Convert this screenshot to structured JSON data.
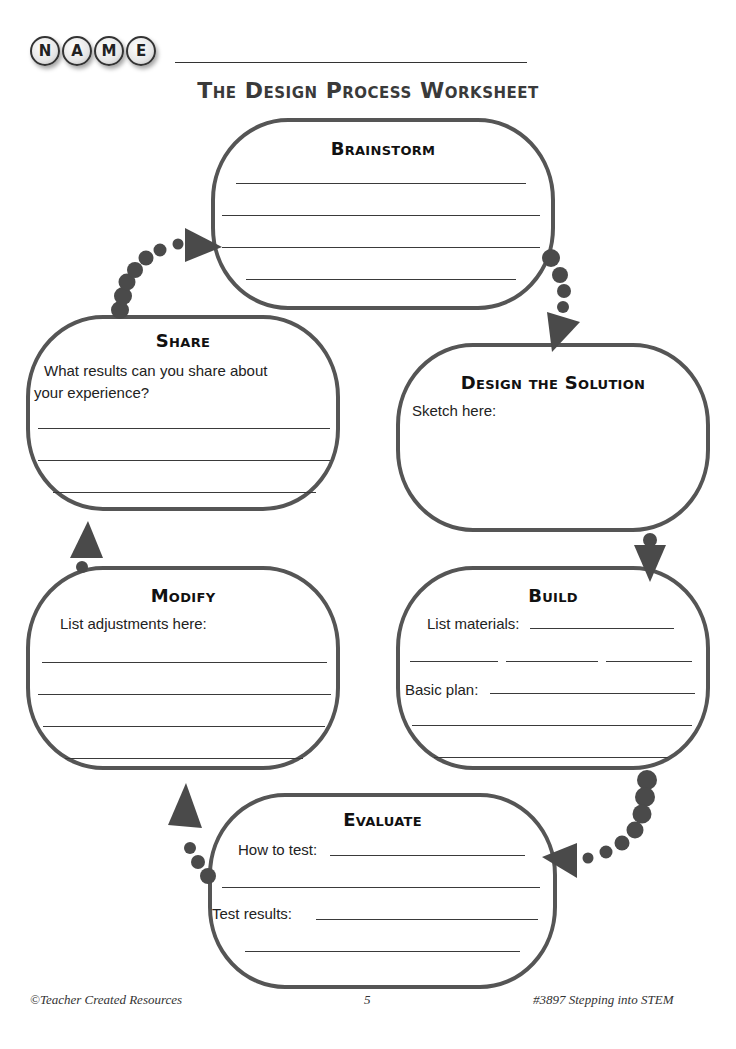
{
  "header": {
    "name_letters": [
      "N",
      "A",
      "M",
      "E"
    ],
    "title": "The Design Process Worksheet"
  },
  "colors": {
    "outline": "#555555",
    "arrow": "#4a4a4a",
    "text": "#222222"
  },
  "steps": {
    "brainstorm": {
      "heading": "Brainstorm"
    },
    "design": {
      "heading": "Design the Solution",
      "prompt": "Sketch here:"
    },
    "build": {
      "heading": "Build",
      "materials_label": "List materials:",
      "plan_label": "Basic plan:"
    },
    "evaluate": {
      "heading": "Evaluate",
      "how_label": "How to test:",
      "results_label": "Test results:"
    },
    "modify": {
      "heading": "Modify",
      "prompt": "List adjustments here:"
    },
    "share": {
      "heading": "Share",
      "prompt_line1": "What results can you share about",
      "prompt_line2": "your experience?"
    }
  },
  "footer": {
    "left": "©Teacher Created Resources",
    "page_number": "5",
    "right": "#3897 Stepping into STEM"
  }
}
